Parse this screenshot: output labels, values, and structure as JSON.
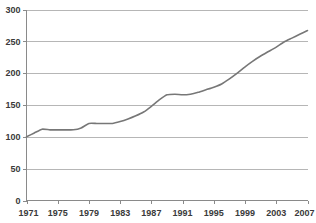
{
  "chart_data": {
    "type": "line",
    "title": "",
    "subtitle": "",
    "xlabel": "",
    "ylabel": "",
    "xlim": [
      1971,
      2007
    ],
    "ylim": [
      0,
      300
    ],
    "grid": true,
    "legend": false,
    "legend_position": "none",
    "y_ticks": [
      0,
      50,
      100,
      150,
      200,
      250,
      300
    ],
    "y_tick_labels": [
      "0",
      "50",
      "100",
      "150",
      "200",
      "250",
      "300"
    ],
    "x_ticks": [
      1971,
      1975,
      1979,
      1983,
      1987,
      1991,
      1995,
      1999,
      2003,
      2007
    ],
    "x_tick_labels": [
      "1971",
      "1975",
      "1979",
      "1983",
      "1987",
      "1991",
      "1995",
      "1999",
      "2003",
      "2007"
    ],
    "x": [
      1971,
      1972,
      1973,
      1974,
      1975,
      1976,
      1977,
      1978,
      1979,
      1980,
      1981,
      1982,
      1983,
      1984,
      1985,
      1986,
      1987,
      1988,
      1989,
      1990,
      1991,
      1992,
      1993,
      1994,
      1995,
      1996,
      1997,
      1998,
      1999,
      2000,
      2001,
      2002,
      2003,
      2004,
      2005,
      2006,
      2007
    ],
    "values": [
      100,
      106,
      112,
      111,
      111,
      111,
      111,
      114,
      121,
      121,
      121,
      121,
      124,
      128,
      133,
      139,
      148,
      158,
      166,
      167,
      166,
      167,
      170,
      174,
      178,
      183,
      191,
      200,
      210,
      219,
      227,
      234,
      241,
      249,
      255,
      261,
      267
    ],
    "series": [
      {
        "name": "Index",
        "color": "#777777",
        "values": [
          100,
          106,
          112,
          111,
          111,
          111,
          111,
          114,
          121,
          121,
          121,
          121,
          124,
          128,
          133,
          139,
          148,
          158,
          166,
          167,
          166,
          167,
          170,
          174,
          178,
          183,
          191,
          200,
          210,
          219,
          227,
          234,
          241,
          249,
          255,
          261,
          267
        ]
      }
    ],
    "colors": {
      "line": "#777777",
      "gridline": "#b6b6b6",
      "axis": "#8a8a8a",
      "label": "#3a3a3a",
      "background": "#ffffff"
    }
  }
}
